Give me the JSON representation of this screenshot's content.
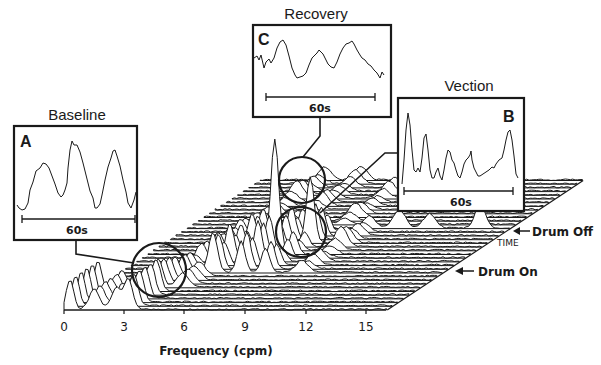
{
  "chart_data": {
    "type": "waterfall",
    "title": "",
    "xlabel": "Frequency (cpm)",
    "ylabel": "",
    "zlabel": "TIME",
    "x_ticks": [
      0,
      3,
      6,
      9,
      12,
      15
    ],
    "xlim": [
      0,
      16
    ],
    "grid": false,
    "legend": null,
    "annotations": [
      {
        "text": "Drum Off",
        "arrow": true
      },
      {
        "text": "Drum On",
        "arrow": true
      },
      {
        "text": "TIME"
      }
    ],
    "dominant_peaks_cpm": [
      {
        "epoch": "Baseline",
        "freq": 3.0
      },
      {
        "epoch": "Vection",
        "freq": 6.0
      },
      {
        "epoch": "Recovery",
        "freq": 3.0
      }
    ],
    "insets": [
      {
        "id": "A",
        "title": "Baseline",
        "scale_bar": "60s",
        "description": "regular ~3 cpm sinusoidal EGG trace"
      },
      {
        "id": "B",
        "title": "Vection",
        "scale_bar": "60s",
        "description": "irregular tachygastric EGG trace"
      },
      {
        "id": "C",
        "title": "Recovery",
        "scale_bar": "60s",
        "description": "returning ~3 cpm EGG trace"
      }
    ]
  },
  "axis": {
    "title": "Frequency (cpm)",
    "ticks": [
      "0",
      "3",
      "6",
      "9",
      "12",
      "15"
    ]
  },
  "labels": {
    "drum_off": "Drum Off",
    "drum_on": "Drum On",
    "time": "TIME"
  },
  "insets": {
    "a": {
      "title": "Baseline",
      "letter": "A",
      "scale": "60s"
    },
    "b": {
      "title": "Vection",
      "letter": "B",
      "scale": "60s"
    },
    "c": {
      "title": "Recovery",
      "letter": "C",
      "scale": "60s"
    }
  }
}
